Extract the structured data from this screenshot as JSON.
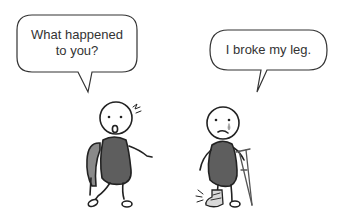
{
  "comic": {
    "left_bubble": {
      "speaker": "backpack-kid",
      "text_line1": "What happened",
      "text_line2": "to you?"
    },
    "right_bubble": {
      "speaker": "injured-kid",
      "text": "I broke my leg."
    }
  },
  "colors": {
    "ink": "#222222",
    "body_fill": "#5e5e5e",
    "backpack_fill": "#8a8a8a",
    "cast_fill": "#d9d9d9",
    "tear": "#9a9a9a",
    "text": "#333333"
  },
  "icons": [
    "speech-bubble",
    "surprise-mark",
    "tear-drop",
    "crutch",
    "leg-cast",
    "pain-lines"
  ]
}
